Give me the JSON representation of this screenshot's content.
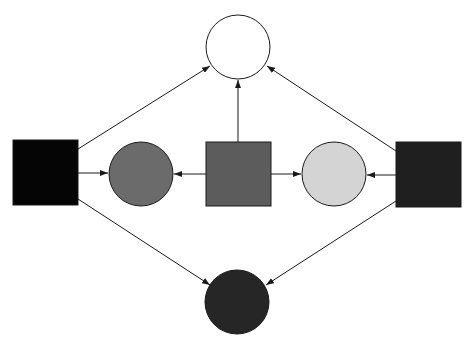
{
  "diagram": {
    "type": "directed-graph",
    "canvas": {
      "width": 475,
      "height": 347,
      "background": "#ffffff"
    },
    "nodes": [
      {
        "id": "top-circle",
        "shape": "circle",
        "cx": 238,
        "cy": 47,
        "r": 32,
        "fill": "#ffffff",
        "label": ""
      },
      {
        "id": "left-square",
        "shape": "square",
        "x": 13,
        "y": 140,
        "w": 65,
        "h": 65,
        "fill": "#050505",
        "label": ""
      },
      {
        "id": "left-circle",
        "shape": "circle",
        "cx": 141,
        "cy": 174,
        "r": 32,
        "fill": "#6b6b6b",
        "label": ""
      },
      {
        "id": "center-square",
        "shape": "square",
        "x": 206,
        "y": 142,
        "w": 65,
        "h": 64,
        "fill": "#5c5c5c",
        "label": ""
      },
      {
        "id": "right-circle",
        "shape": "circle",
        "cx": 334,
        "cy": 174,
        "r": 32,
        "fill": "#d4d4d4",
        "label": ""
      },
      {
        "id": "right-square",
        "shape": "square",
        "x": 396,
        "y": 142,
        "w": 65,
        "h": 65,
        "fill": "#1f1f1f",
        "label": ""
      },
      {
        "id": "bottom-circle",
        "shape": "circle",
        "cx": 237,
        "cy": 302,
        "r": 32,
        "fill": "#262626",
        "label": ""
      }
    ],
    "edges": [
      {
        "id": "e1",
        "from": "left-square",
        "to": "top-circle",
        "x1": 78,
        "y1": 149,
        "x2": 210,
        "y2": 66
      },
      {
        "id": "e2",
        "from": "right-square",
        "to": "top-circle",
        "x1": 396,
        "y1": 151,
        "x2": 267,
        "y2": 66
      },
      {
        "id": "e3",
        "from": "center-square",
        "to": "top-circle",
        "x1": 238,
        "y1": 142,
        "x2": 238,
        "y2": 80
      },
      {
        "id": "e4",
        "from": "left-square",
        "to": "left-circle",
        "x1": 78,
        "y1": 173,
        "x2": 108,
        "y2": 173
      },
      {
        "id": "e5",
        "from": "center-square",
        "to": "left-circle",
        "x1": 206,
        "y1": 174,
        "x2": 174,
        "y2": 174
      },
      {
        "id": "e6",
        "from": "center-square",
        "to": "right-circle",
        "x1": 271,
        "y1": 174,
        "x2": 301,
        "y2": 174
      },
      {
        "id": "e7",
        "from": "right-square",
        "to": "right-circle",
        "x1": 396,
        "y1": 175,
        "x2": 367,
        "y2": 175
      },
      {
        "id": "e8",
        "from": "left-square",
        "to": "bottom-circle",
        "x1": 78,
        "y1": 199,
        "x2": 210,
        "y2": 285
      },
      {
        "id": "e9",
        "from": "right-square",
        "to": "bottom-circle",
        "x1": 396,
        "y1": 201,
        "x2": 266,
        "y2": 285
      }
    ],
    "edge_color": "#1a1a1a"
  }
}
